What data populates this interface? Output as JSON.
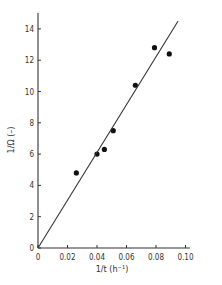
{
  "chart_data": {
    "type": "scatter",
    "title": "",
    "xlabel": "1/t (h⁻¹)",
    "ylabel": "1/Ω (–)",
    "xlim": [
      0,
      0.105
    ],
    "ylim": [
      0,
      15
    ],
    "x_ticks": [
      0,
      0.02,
      0.04,
      0.06,
      0.08,
      0.1
    ],
    "x_tick_labels": [
      "0",
      "0.02",
      "0.04",
      "0.06",
      "0.08",
      "0.10"
    ],
    "y_ticks": [
      0,
      2,
      4,
      6,
      8,
      10,
      12,
      14
    ],
    "y_tick_labels": [
      "0",
      "2",
      "4",
      "6",
      "8",
      "10",
      "12",
      "14"
    ],
    "grid": false,
    "legend": null,
    "series": [
      {
        "name": "measured",
        "marker": "filled-circle",
        "x": [
          0.026,
          0.04,
          0.045,
          0.051,
          0.066,
          0.079,
          0.089
        ],
        "y": [
          4.8,
          6.0,
          6.3,
          7.5,
          10.4,
          12.8,
          12.4
        ]
      },
      {
        "name": "fit line",
        "style": "line",
        "x": [
          0,
          0.095
        ],
        "y": [
          0,
          14.5
        ]
      }
    ]
  }
}
